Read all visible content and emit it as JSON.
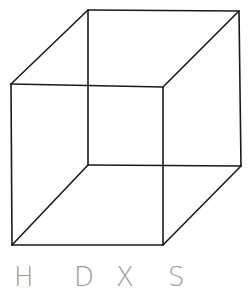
{
  "diagram": {
    "type": "wireframe-cube",
    "stroke_color": "#1a1a1a",
    "stroke_width": 1.6,
    "vertices": {
      "front_top_left": [
        11,
        84
      ],
      "front_top_right": [
        163,
        87
      ],
      "front_bottom_left": [
        12,
        245
      ],
      "front_bottom_right": [
        163,
        245
      ],
      "back_top_left": [
        88,
        10
      ],
      "back_top_right": [
        239,
        11
      ],
      "back_bottom_left": [
        88,
        165
      ],
      "back_bottom_right": [
        241,
        166
      ]
    },
    "edges": [
      [
        "front_top_left",
        "front_top_right"
      ],
      [
        "front_top_right",
        "front_bottom_right"
      ],
      [
        "front_bottom_right",
        "front_bottom_left"
      ],
      [
        "front_bottom_left",
        "front_top_left"
      ],
      [
        "back_top_left",
        "back_top_right"
      ],
      [
        "back_top_right",
        "back_bottom_right"
      ],
      [
        "back_bottom_right",
        "back_bottom_left"
      ],
      [
        "back_bottom_left",
        "back_top_left"
      ],
      [
        "front_top_left",
        "back_top_left"
      ],
      [
        "front_top_right",
        "back_top_right"
      ],
      [
        "front_bottom_left",
        "back_bottom_left"
      ],
      [
        "front_bottom_right",
        "back_bottom_right"
      ]
    ]
  },
  "labels": [
    {
      "text": "H",
      "x": 14
    },
    {
      "text": "D",
      "x": 74
    },
    {
      "text": "X",
      "x": 116
    },
    {
      "text": "S",
      "x": 168
    }
  ],
  "label_color": "#9a9a9a"
}
